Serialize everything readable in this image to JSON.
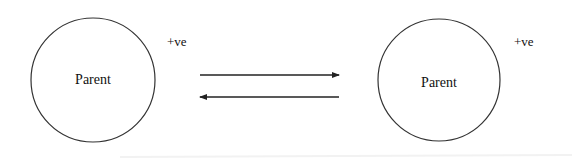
{
  "diagram": {
    "nodes": [
      {
        "id": "left",
        "label": "Parent",
        "charge": "+ve"
      },
      {
        "id": "right",
        "label": "Parent",
        "charge": "+ve"
      }
    ],
    "arrows": [
      {
        "from": "left",
        "to": "right",
        "direction": "right"
      },
      {
        "from": "right",
        "to": "left",
        "direction": "left"
      }
    ],
    "colors": {
      "stroke": "#333333",
      "background": "#ffffff"
    }
  }
}
